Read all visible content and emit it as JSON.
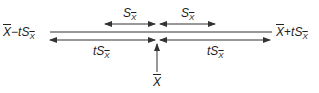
{
  "diagram": {
    "colors": {
      "line": "#333333",
      "text": "#222222",
      "background": "#ffffff"
    },
    "labels": {
      "left_bound": {
        "mean": "X",
        "op": "−",
        "coef": "t",
        "s": "S",
        "sub": "X"
      },
      "right_bound": {
        "mean": "X",
        "op": "+",
        "coef": "t",
        "s": "S",
        "sub": "X"
      },
      "top_left_span": {
        "s": "S",
        "sub": "X"
      },
      "top_right_span": {
        "s": "S",
        "sub": "X"
      },
      "bottom_left_span": {
        "coef": "t",
        "s": "S",
        "sub": "X"
      },
      "bottom_right_span": {
        "coef": "t",
        "s": "S",
        "sub": "X"
      },
      "center": {
        "mean": "X"
      }
    },
    "arrows": [
      {
        "name": "top-left-span-arrow",
        "from": 105,
        "to": 155,
        "y": 24,
        "heads": "both"
      },
      {
        "name": "top-right-span-arrow",
        "from": 160,
        "to": 215,
        "y": 24,
        "heads": "both"
      },
      {
        "name": "main-interval-line",
        "from": 50,
        "to": 272,
        "y": 32,
        "heads": "none"
      },
      {
        "name": "bottom-left-span-arrow",
        "from": 50,
        "to": 155,
        "y": 40,
        "heads": "both"
      },
      {
        "name": "bottom-right-span-arrow",
        "from": 160,
        "to": 270,
        "y": 40,
        "heads": "both"
      },
      {
        "name": "center-pointer-arrow",
        "x": 157,
        "from": 72,
        "to": 44,
        "heads": "end"
      }
    ]
  }
}
